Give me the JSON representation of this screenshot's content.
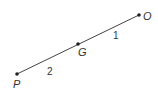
{
  "diagram": {
    "points": {
      "P": {
        "label": "P",
        "x": 17,
        "y": 74
      },
      "G": {
        "label": "G",
        "x": 78,
        "y": 44
      },
      "O": {
        "label": "O",
        "x": 139,
        "y": 15
      }
    },
    "segments": [
      {
        "from": "P",
        "to": "G",
        "ratio_label": "2"
      },
      {
        "from": "G",
        "to": "O",
        "ratio_label": "1"
      }
    ],
    "line_color": "#333333"
  }
}
